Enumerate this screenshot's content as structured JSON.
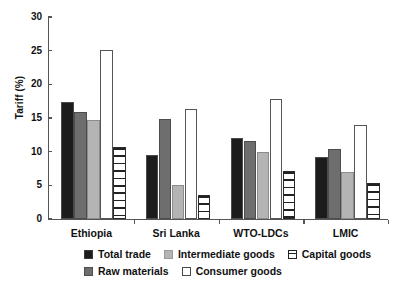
{
  "chart_data": {
    "type": "bar",
    "title": "",
    "xlabel": "",
    "ylabel": "Tariff (%)",
    "ylim": [
      0,
      30
    ],
    "yticks": [
      0,
      5,
      10,
      15,
      20,
      25,
      30
    ],
    "grid": false,
    "legend_position": "bottom",
    "categories": [
      "Ethiopia",
      "Sri Lanka",
      "WTO-LDCs",
      "LMIC"
    ],
    "series": [
      {
        "name": "Total trade",
        "key": "total",
        "style": "solid-black",
        "color": "#1c1c1c",
        "values": [
          17.4,
          9.5,
          12.1,
          9.2
        ]
      },
      {
        "name": "Raw materials",
        "key": "raw",
        "style": "solid-dark-gray",
        "color": "#6e6e6e",
        "values": [
          15.9,
          14.8,
          11.6,
          10.4
        ]
      },
      {
        "name": "Intermediate goods",
        "key": "inter",
        "style": "solid-light-gray",
        "color": "#b4b4b4",
        "values": [
          14.7,
          5.0,
          10.0,
          7.0
        ]
      },
      {
        "name": "Consumer goods",
        "key": "consumer",
        "style": "open-white",
        "color": "#ffffff",
        "values": [
          25.1,
          16.3,
          17.8,
          13.9
        ]
      },
      {
        "name": "Capital goods",
        "key": "capital",
        "style": "horizontal-stripes",
        "color": "#ffffff",
        "values": [
          10.7,
          3.6,
          7.2,
          5.3
        ]
      }
    ]
  },
  "axis": {
    "y_title": "Tariff (%)",
    "y_tick_labels": [
      "0",
      "5",
      "10",
      "15",
      "20",
      "25",
      "30"
    ],
    "x_tick_labels": [
      "Ethiopia",
      "Sri Lanka",
      "WTO-LDCs",
      "LMIC"
    ]
  },
  "legend": {
    "row1": [
      {
        "label": "Total trade",
        "swatch": "solid-black-swatch"
      },
      {
        "label": "Intermediate goods",
        "swatch": "solid-light-gray-swatch"
      },
      {
        "label": "Capital goods",
        "swatch": "striped-swatch"
      }
    ],
    "row2": [
      {
        "label": "Raw materials",
        "swatch": "solid-dark-gray-swatch"
      },
      {
        "label": "Consumer goods",
        "swatch": "open-white-swatch"
      }
    ]
  }
}
